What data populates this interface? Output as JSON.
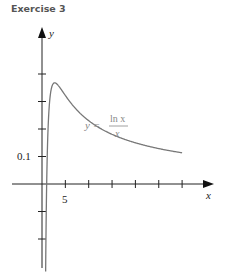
{
  "title": "Exercise 3",
  "chart_data": {
    "type": "line",
    "title": "Exercise 3",
    "xlabel": "x",
    "ylabel": "y",
    "series": [
      {
        "name": "y = ln x / x",
        "function": "ln(x)/x",
        "x_range": [
          0.78,
          30
        ]
      }
    ],
    "annotation": {
      "text_lhs": "y =",
      "numerator": "ln x",
      "denominator": "x"
    },
    "x_ticks": [
      5,
      10,
      15,
      20,
      25,
      30
    ],
    "x_tick_labels": {
      "5": "5"
    },
    "y_ticks": [
      -0.2,
      -0.1,
      0.1,
      0.2,
      0.3,
      0.4
    ],
    "y_tick_labels": {
      "0.1": "0.1"
    },
    "xlim": [
      -7,
      36
    ],
    "ylim": [
      -0.33,
      0.57
    ],
    "grid": false,
    "colors": {
      "axes": "#222222",
      "curve": "#777777",
      "annotation": "#888888"
    }
  },
  "labels": {
    "x_axis": "x",
    "y_axis": "y",
    "tick_5": "5",
    "tick_0_1": "0.1",
    "eq_lhs": "y =",
    "eq_num": "ln x",
    "eq_den": "x"
  }
}
